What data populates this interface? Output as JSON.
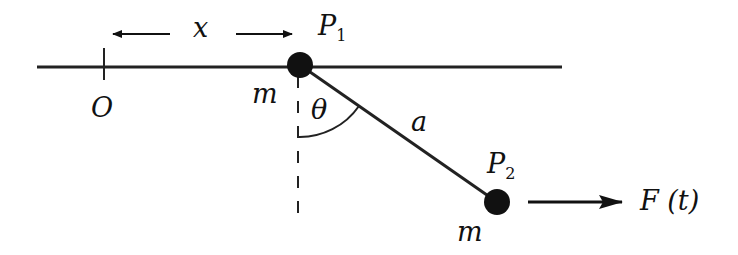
{
  "diagram": {
    "type": "mechanics-pendulum-on-rail",
    "colors": {
      "ink": "#111111",
      "background": "#ffffff"
    },
    "rail": {
      "x1": 37,
      "x2": 562,
      "y": 67
    },
    "origin": {
      "label": "O",
      "tick_x": 104
    },
    "displacement": {
      "label": "x"
    },
    "particles": [
      {
        "id": "P1",
        "label_main": "P",
        "label_sub": "1",
        "mass_label": "m",
        "cx": 300,
        "cy": 65
      },
      {
        "id": "P2",
        "label_main": "P",
        "label_sub": "2",
        "mass_label": "m",
        "cx": 497,
        "cy": 202
      }
    ],
    "rod": {
      "label": "a"
    },
    "angle": {
      "label": "θ"
    },
    "force": {
      "label_main": "F",
      "label_arg": "(t)"
    }
  }
}
